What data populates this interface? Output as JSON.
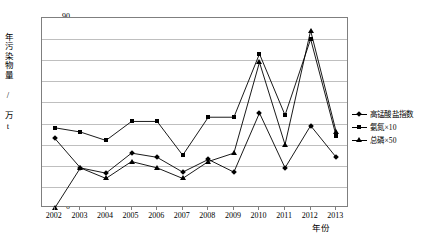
{
  "chart_data": {
    "type": "line",
    "title": "",
    "xlabel": "年份",
    "ylabel": "年污染物量 / 万t",
    "categories": [
      "2002",
      "2003",
      "2004",
      "2005",
      "2006",
      "2007",
      "2008",
      "2009",
      "2010",
      "2011",
      "2012",
      "2013"
    ],
    "ylim": [
      0,
      90
    ],
    "ytick_step": 10,
    "yticks": [
      "0",
      "10",
      "20",
      "30",
      "40",
      "50",
      "60",
      "70",
      "80",
      "90"
    ],
    "grid": true,
    "legend_position": "right",
    "series": [
      {
        "name": "高锰酸盐指数",
        "marker": "diamond",
        "color": "#000000",
        "values": [
          33,
          19,
          16.5,
          26,
          24,
          17,
          23,
          17,
          45,
          19,
          39,
          24
        ]
      },
      {
        "name": "氨氮×10",
        "marker": "square",
        "color": "#000000",
        "values": [
          38,
          36,
          32,
          41,
          41,
          25,
          43,
          43,
          73,
          44,
          80,
          34
        ]
      },
      {
        "name": "总磷×50",
        "marker": "triangle",
        "color": "#000000",
        "values": [
          0,
          19,
          14,
          22,
          19,
          14,
          22,
          26,
          69,
          30,
          84,
          36
        ]
      }
    ]
  },
  "axis": {
    "y_title": "年污染物量 / 万t",
    "x_title": "年份"
  },
  "legend": {
    "items": [
      {
        "label": "高锰酸盐指数"
      },
      {
        "label": "氨氮×10"
      },
      {
        "label": "总磷×50"
      }
    ]
  },
  "colors": {
    "plot_border": "#7f7f7f",
    "gridline": "#bfbfbf",
    "series": "#000000",
    "background": "#ffffff"
  }
}
